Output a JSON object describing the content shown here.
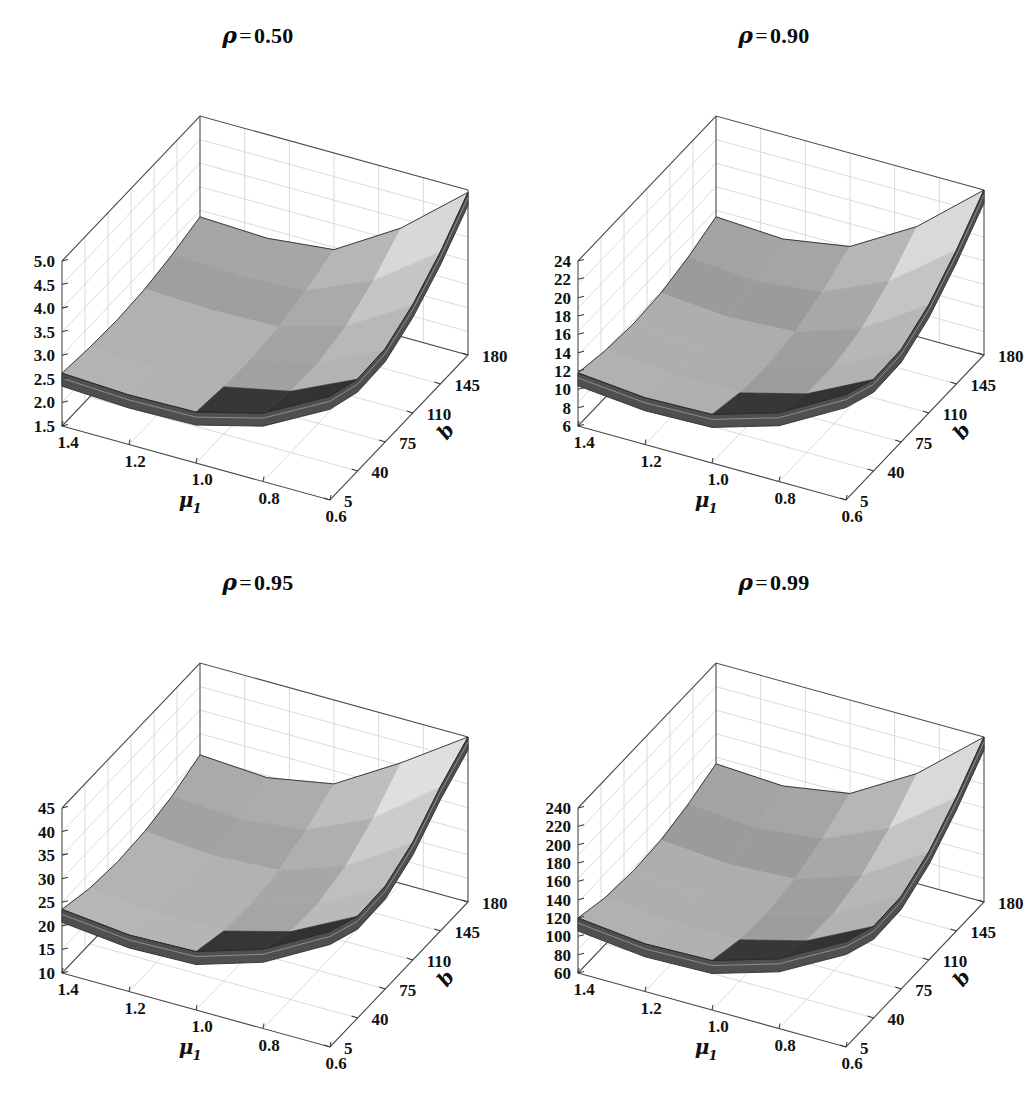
{
  "figure": {
    "layout": "2x2 grid of 3D surface plots",
    "background": "#ffffff"
  },
  "chart_data": [
    {
      "type": "surface3d",
      "panel_index": 0,
      "title": "ρ = 0.50",
      "title_symbol": "ρ",
      "title_eq": "=",
      "title_value": "0.50",
      "xlabel": "μ",
      "xlabel_sub": "1",
      "ylabel": "b",
      "zlabel": "",
      "xticks": [
        "1.4",
        "1.2",
        "1.0",
        "0.8",
        "0.6"
      ],
      "x": [
        1.4,
        1.2,
        1.0,
        0.8,
        0.6
      ],
      "yticks": [
        "5",
        "40",
        "75",
        "110",
        "145",
        "180"
      ],
      "y": [
        5,
        40,
        75,
        110,
        145,
        180
      ],
      "zticks": [
        "1.5",
        "2.0",
        "2.5",
        "3.0",
        "3.5",
        "4.0",
        "4.5",
        "5.0"
      ],
      "zlim": [
        1.5,
        5.0
      ],
      "z_rows": [
        [
          2.62,
          2.55,
          2.52,
          2.56,
          2.68,
          2.86
        ],
        [
          2.55,
          2.48,
          2.46,
          2.5,
          2.62,
          2.8
        ],
        [
          2.58,
          2.5,
          2.48,
          2.54,
          2.7,
          2.95
        ],
        [
          2.95,
          2.8,
          2.78,
          2.95,
          3.3,
          3.8
        ],
        [
          3.7,
          3.45,
          3.48,
          3.8,
          4.3,
          4.95
        ]
      ],
      "grid": true,
      "legend": "none"
    },
    {
      "type": "surface3d",
      "panel_index": 1,
      "title": "ρ = 0.90",
      "title_symbol": "ρ",
      "title_eq": "=",
      "title_value": "0.90",
      "xlabel": "μ",
      "xlabel_sub": "1",
      "ylabel": "b",
      "zlabel": "",
      "xticks": [
        "1.4",
        "1.2",
        "1.0",
        "0.8",
        "0.6"
      ],
      "x": [
        1.4,
        1.2,
        1.0,
        0.8,
        0.6
      ],
      "yticks": [
        "5",
        "40",
        "75",
        "110",
        "145",
        "180"
      ],
      "y": [
        5,
        40,
        75,
        110,
        145,
        180
      ],
      "zticks": [
        "6",
        "8",
        "10",
        "12",
        "14",
        "16",
        "18",
        "20",
        "22",
        "24"
      ],
      "zlim": [
        6,
        24
      ],
      "z_rows": [
        [
          11.8,
          11.1,
          10.8,
          11.0,
          11.8,
          13.0
        ],
        [
          11.1,
          10.4,
          10.1,
          10.4,
          11.2,
          12.6
        ],
        [
          11.3,
          10.5,
          10.3,
          10.8,
          12.0,
          13.8
        ],
        [
          13.5,
          12.4,
          12.3,
          13.2,
          15.2,
          18.0
        ],
        [
          17.5,
          16.0,
          16.1,
          17.8,
          20.6,
          24.0
        ]
      ],
      "grid": true,
      "legend": "none"
    },
    {
      "type": "surface3d",
      "panel_index": 2,
      "title": "ρ = 0.95",
      "title_symbol": "ρ",
      "title_eq": "=",
      "title_value": "0.95",
      "xlabel": "μ",
      "xlabel_sub": "1",
      "ylabel": "b",
      "zlabel": "",
      "xticks": [
        "1.4",
        "1.2",
        "1.0",
        "0.8",
        "0.6"
      ],
      "x": [
        1.4,
        1.2,
        1.0,
        0.8,
        0.6
      ],
      "yticks": [
        "5",
        "40",
        "75",
        "110",
        "145",
        "180"
      ],
      "y": [
        5,
        40,
        75,
        110,
        145,
        180
      ],
      "zticks": [
        "10",
        "15",
        "20",
        "25",
        "30",
        "35",
        "40",
        "45"
      ],
      "zlim": [
        10,
        45
      ],
      "z_rows": [
        [
          23.5,
          21.8,
          21.2,
          21.6,
          23.0,
          25.5
        ],
        [
          22.0,
          20.4,
          19.8,
          20.4,
          22.0,
          24.6
        ],
        [
          22.4,
          20.6,
          20.2,
          21.2,
          23.6,
          27.2
        ],
        [
          26.8,
          24.4,
          24.2,
          26.0,
          30.0,
          35.6
        ],
        [
          34.5,
          31.6,
          31.8,
          35.0,
          40.6,
          45.0
        ]
      ],
      "grid": true,
      "legend": "none"
    },
    {
      "type": "surface3d",
      "panel_index": 3,
      "title": "ρ = 0.99",
      "title_symbol": "ρ",
      "title_eq": "=",
      "title_value": "0.99",
      "xlabel": "μ",
      "xlabel_sub": "1",
      "ylabel": "b",
      "zlabel": "",
      "xticks": [
        "1.4",
        "1.2",
        "1.0",
        "0.8",
        "0.6"
      ],
      "x": [
        1.4,
        1.2,
        1.0,
        0.8,
        0.6
      ],
      "yticks": [
        "5",
        "40",
        "75",
        "110",
        "145",
        "180"
      ],
      "y": [
        5,
        40,
        75,
        110,
        145,
        180
      ],
      "zticks": [
        "60",
        "80",
        "100",
        "120",
        "140",
        "160",
        "180",
        "200",
        "220",
        "240"
      ],
      "zlim": [
        60,
        240
      ],
      "z_rows": [
        [
          120,
          111,
          108,
          110,
          118,
          130
        ],
        [
          112,
          103,
          100,
          104,
          112,
          126
        ],
        [
          114,
          105,
          103,
          108,
          120,
          138
        ],
        [
          136,
          124,
          123,
          132,
          152,
          180
        ],
        [
          175,
          160,
          161,
          178,
          206,
          240
        ]
      ],
      "grid": true,
      "legend": "none"
    }
  ]
}
